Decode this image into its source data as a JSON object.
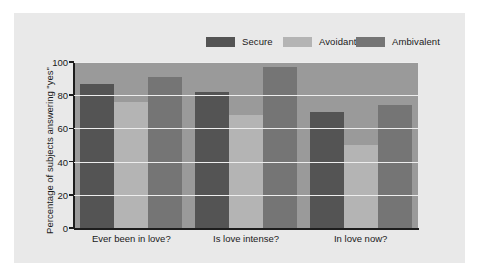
{
  "figure": {
    "background_color": "#ffffff",
    "panel_color": "#e9e9e9"
  },
  "legend": {
    "position": "top-right",
    "entries": [
      {
        "label": "Secure",
        "color": "#545454",
        "name": "legend-secure"
      },
      {
        "label": "Avoidant",
        "color": "#b4b4b4",
        "name": "legend-avoidant"
      },
      {
        "label": "Ambivalent",
        "color": "#757575",
        "name": "legend-ambivalent"
      }
    ]
  },
  "axes": {
    "ylabel": "Percentage of subjects answering \"yes\"",
    "xlabel": "",
    "yticks": [
      "0",
      "20",
      "40",
      "60",
      "80",
      "100"
    ],
    "ylim": [
      0,
      100
    ],
    "plot_background": "#9a9a9a",
    "gridline_color": "#ededed"
  },
  "chart_data": {
    "type": "bar",
    "title": "",
    "xlabel": "",
    "ylabel": "Percentage of subjects answering \"yes\"",
    "ylim": [
      0,
      100
    ],
    "yticks": [
      0,
      20,
      40,
      60,
      80,
      100
    ],
    "grid": "horizontal",
    "legend_position": "top-right",
    "categories": [
      "Ever been in love?",
      "Is love intense?",
      "In love now?"
    ],
    "series": [
      {
        "name": "Secure",
        "color": "#545454",
        "values": [
          87,
          82,
          70
        ]
      },
      {
        "name": "Avoidant",
        "color": "#b4b4b4",
        "values": [
          76,
          68,
          50
        ]
      },
      {
        "name": "Ambivalent",
        "color": "#757575",
        "values": [
          91,
          97,
          74
        ]
      }
    ]
  }
}
